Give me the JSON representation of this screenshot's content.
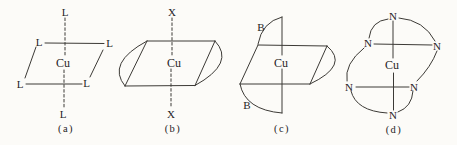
{
  "figure": {
    "colors": {
      "ink": "#3c3a36",
      "text_ink": "#26241f",
      "background": "#fcfbf8"
    },
    "panels": {
      "a": {
        "caption": "(a)",
        "metal_label": "Cu",
        "axial_top_label": "L",
        "axial_bottom_label": "L",
        "plane_top_left_label": "L",
        "plane_top_right_label": "L",
        "plane_bottom_left_label": "L",
        "plane_bottom_right_label": "L"
      },
      "b": {
        "caption": "(b)",
        "metal_label": "Cu",
        "axial_top_label": "X",
        "axial_bottom_label": "X"
      },
      "c": {
        "caption": "(c)",
        "metal_label": "Cu",
        "top_ligand_label": "B",
        "bottom_ligand_label": "B"
      },
      "d": {
        "caption": "(d)",
        "metal_label": "Cu",
        "macrocycle_top_label": "N",
        "macrocycle_upper_left_label": "N",
        "macrocycle_upper_right_label": "N",
        "macrocycle_lower_left_label": "N",
        "macrocycle_lower_right_label": "N",
        "macrocycle_bottom_label": "N"
      }
    }
  }
}
